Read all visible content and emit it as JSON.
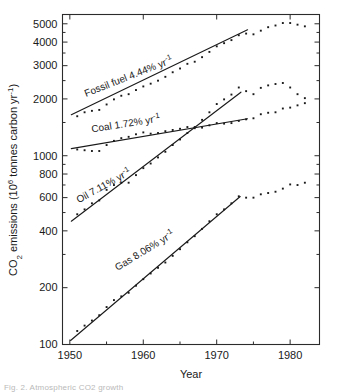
{
  "figure": {
    "caption_fragment": "Fig. 2. Atmospheric CO2 growth"
  },
  "chart_data": {
    "type": "line",
    "title": "",
    "xlabel": "Year",
    "ylabel": "CO₂ emissions (10⁶ tonnes carbon yr⁻¹)",
    "ylabel_parts": {
      "lead": "CO",
      "sub": "2",
      "mid": " emissions (10",
      "sup": "6",
      "tail": " tonnes carbon yr",
      "sup2": "-1",
      "close": ")"
    },
    "yscale": "log",
    "xscale": "linear",
    "xlim": [
      1949,
      1984
    ],
    "ylim": [
      100,
      5600
    ],
    "grid": false,
    "legend": "inline-annotations",
    "xticks": [
      1950,
      1960,
      1970,
      1980
    ],
    "xticklabels": [
      "1950",
      "1960",
      "1970",
      "1980"
    ],
    "xminorticks": [
      1955,
      1965,
      1975
    ],
    "yticks": [
      100,
      200,
      400,
      600,
      800,
      1000,
      2000,
      3000,
      4000,
      5000
    ],
    "yticklabels": [
      "100",
      "200",
      "400",
      "600",
      "800",
      "1000",
      "2000",
      "3000",
      "4000",
      "5000"
    ],
    "yminorticks": [
      300,
      500,
      700,
      900,
      1500,
      2500,
      3500,
      4500
    ],
    "annotations": [
      {
        "name": "fossil-fuel",
        "text": "Fossil fuel 4.44% yr",
        "sup": "-1",
        "rate_percent": 4.44,
        "x": 1952.2,
        "y": 2050,
        "rotation": -21.5
      },
      {
        "name": "coal",
        "text": "Coal 1.72% yr",
        "sup": "-1",
        "rate_percent": 1.72,
        "x": 1953.0,
        "y": 1330,
        "rotation": -9.0
      },
      {
        "name": "oil",
        "text": "Oil 7.11% yr",
        "sup": "-1",
        "rate_percent": 7.11,
        "x": 1951.2,
        "y": 560,
        "rotation": -29.0
      },
      {
        "name": "gas",
        "text": "Gas 8.06% yr",
        "sup": "-1",
        "rate_percent": 8.06,
        "x": 1956.5,
        "y": 245,
        "rotation": -31.5
      }
    ],
    "series": [
      {
        "name": "Fossil fuel",
        "label": "Fossil fuel 4.44% yr⁻¹",
        "rate_percent": 4.44,
        "fit_line": {
          "x": [
            1950.2,
            1974.2
          ],
          "y": [
            1650,
            4650
          ]
        },
        "x": [
          1951,
          1952,
          1953,
          1954,
          1955,
          1956,
          1957,
          1958,
          1959,
          1960,
          1961,
          1962,
          1963,
          1964,
          1965,
          1966,
          1967,
          1968,
          1969,
          1970,
          1971,
          1972,
          1973,
          1974,
          1975,
          1976,
          1977,
          1978,
          1979,
          1980,
          1981,
          1982
        ],
        "y": [
          1620,
          1700,
          1730,
          1750,
          1870,
          1990,
          2080,
          2120,
          2230,
          2330,
          2410,
          2500,
          2620,
          2770,
          2900,
          3070,
          3150,
          3330,
          3550,
          3800,
          3950,
          4100,
          4350,
          4440,
          4400,
          4600,
          4800,
          4900,
          5050,
          5050,
          4950,
          4850
        ]
      },
      {
        "name": "Coal",
        "label": "Coal 1.72% yr⁻¹",
        "rate_percent": 1.72,
        "fit_line": {
          "x": [
            1950.2,
            1974.2
          ],
          "y": [
            1090,
            1570
          ]
        },
        "x": [
          1951,
          1952,
          1953,
          1954,
          1955,
          1956,
          1957,
          1958,
          1959,
          1960,
          1961,
          1962,
          1963,
          1964,
          1965,
          1966,
          1967,
          1968,
          1969,
          1970,
          1971,
          1972,
          1973,
          1974,
          1975,
          1976,
          1977,
          1978,
          1979,
          1980,
          1981,
          1982
        ],
        "y": [
          1080,
          1070,
          1060,
          1060,
          1140,
          1200,
          1240,
          1260,
          1300,
          1330,
          1310,
          1320,
          1350,
          1370,
          1390,
          1420,
          1400,
          1410,
          1450,
          1490,
          1480,
          1490,
          1530,
          1560,
          1580,
          1660,
          1690,
          1700,
          1780,
          1800,
          1850,
          1900
        ]
      },
      {
        "name": "Oil",
        "label": "Oil 7.11% yr⁻¹",
        "rate_percent": 7.11,
        "fit_line": {
          "x": [
            1950.2,
            1973.3
          ],
          "y": [
            450,
            2170
          ]
        },
        "x": [
          1951,
          1952,
          1953,
          1954,
          1955,
          1956,
          1957,
          1958,
          1959,
          1960,
          1961,
          1962,
          1963,
          1964,
          1965,
          1966,
          1967,
          1968,
          1969,
          1970,
          1971,
          1972,
          1973,
          1974,
          1975,
          1976,
          1977,
          1978,
          1979,
          1980,
          1981,
          1982
        ],
        "y": [
          490,
          520,
          560,
          580,
          660,
          700,
          720,
          720,
          790,
          860,
          910,
          980,
          1050,
          1140,
          1220,
          1320,
          1420,
          1550,
          1700,
          1880,
          1990,
          2110,
          2300,
          2200,
          2120,
          2290,
          2360,
          2400,
          2430,
          2300,
          2120,
          2020
        ]
      },
      {
        "name": "Gas",
        "label": "Gas 8.06% yr⁻¹",
        "rate_percent": 8.06,
        "fit_line": {
          "x": [
            1950.1,
            1973.2
          ],
          "y": [
            105,
            608
          ]
        },
        "x": [
          1951,
          1952,
          1953,
          1954,
          1955,
          1956,
          1957,
          1958,
          1959,
          1960,
          1961,
          1962,
          1963,
          1964,
          1965,
          1966,
          1967,
          1968,
          1969,
          1970,
          1971,
          1972,
          1973,
          1974,
          1975,
          1976,
          1977,
          1978,
          1979,
          1980,
          1981,
          1982
        ],
        "y": [
          118,
          126,
          134,
          143,
          158,
          172,
          180,
          188,
          205,
          222,
          238,
          255,
          272,
          295,
          320,
          348,
          375,
          410,
          450,
          490,
          520,
          560,
          610,
          600,
          600,
          625,
          635,
          645,
          670,
          705,
          700,
          720
        ]
      }
    ]
  }
}
